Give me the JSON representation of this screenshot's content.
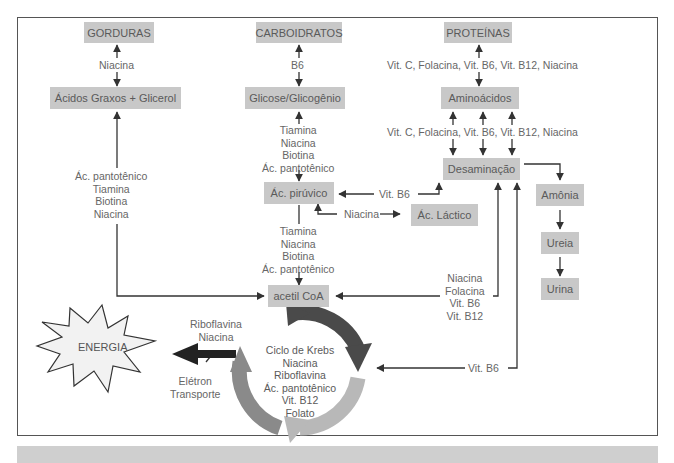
{
  "diagram": {
    "title": "",
    "nodes": {
      "gorduras": "GORDURAS",
      "carboidratos": "CARBOIDRATOS",
      "proteinas": "PROTEÍNAS",
      "acidos_graxos": "Ácidos Graxos + Glicerol",
      "glicose": "Glicose/Glicogênio",
      "aminoacidos": "Aminoácidos",
      "desaminacao": "Desaminação",
      "ac_piruvico": "Ác. pirúvico",
      "ac_lactico": "Ác. Láctico",
      "amonia": "Amônia",
      "ureia": "Ureia",
      "urina": "Urina",
      "acetil_coa": "acetil CoA",
      "energia": "ENERGIA"
    },
    "edge_labels": {
      "gorduras_acidos": "Niacina",
      "carbo_glicose": "B6",
      "proteinas_amino": "Vit. C, Folacina, Vit. B6, Vit. B12, Niacina",
      "amino_desamin": "Vit. C, Folacina, Vit. B6, Vit. B12, Niacina",
      "glicose_piruvico": [
        "Tiamina",
        "Niacina",
        "Biotina",
        "Ác. pantotênico"
      ],
      "acidos_acetil": [
        "Ác. pantotênico",
        "Tiamina",
        "Biotina",
        "Niacina"
      ],
      "piruvico_acetil": [
        "Tiamina",
        "Niacina",
        "Biotina",
        "Ác. pantotênico"
      ],
      "desamin_piruvico": "Vit. B6",
      "piruvico_lactico": "Niacina",
      "desamin_acetil": [
        "Niacina",
        "Folacina",
        "Vit. B6",
        "Vit. B12"
      ],
      "desamin_krebs": "Vit. B6",
      "krebs_energia_top": [
        "Riboflavina",
        "Niacina"
      ],
      "krebs_energia_bottom": [
        "Elétron",
        "Transporte"
      ]
    },
    "krebs_cycle": {
      "lines": [
        "Ciclo de Krebs",
        "Niacina",
        "Riboflavina",
        "Ác. pantotênico",
        "Vit. B12",
        "Folato"
      ]
    },
    "colors": {
      "box_fill": "#c8c8c8",
      "arrow": "#333333",
      "frame": "#555555",
      "cycle_dark": "#4a4a4a",
      "cycle_mid": "#8a8a8a",
      "cycle_light": "#b8b8b8",
      "footer_bar": "#cfcfcf"
    }
  }
}
